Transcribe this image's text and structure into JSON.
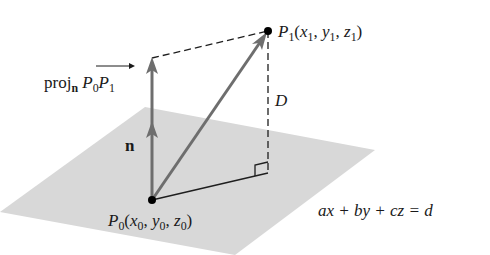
{
  "diagram": {
    "colors": {
      "plane": "#d6d6d6",
      "vector_gray": "#6e6e6e",
      "line_dark": "#1e1e1e",
      "point": "#000000"
    },
    "points": {
      "P0": {
        "name": "P",
        "sub": "0",
        "coords_label": [
          "x",
          "0",
          "y",
          "0",
          "z",
          "0"
        ]
      },
      "P1": {
        "name": "P",
        "sub": "1",
        "coords_label": [
          "x",
          "1",
          "y",
          "1",
          "z",
          "1"
        ]
      }
    },
    "labels": {
      "proj_prefix": "proj",
      "proj_sub": "n",
      "proj_vec_P": "P",
      "proj_vec_sub0": "0",
      "proj_vec_P2": "P",
      "proj_vec_sub1": "1",
      "normal": "n",
      "distance": "D",
      "plane_equation": "ax + by + cz = d"
    }
  }
}
